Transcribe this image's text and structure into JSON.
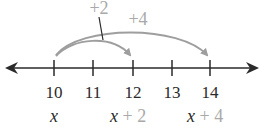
{
  "diagram": {
    "type": "number-line",
    "ticks": [
      {
        "value": "10",
        "x": 54
      },
      {
        "value": "11",
        "x": 93
      },
      {
        "value": "12",
        "x": 133
      },
      {
        "value": "13",
        "x": 172
      },
      {
        "value": "14",
        "x": 210
      }
    ],
    "expressions": [
      {
        "var": "x",
        "suffix": "",
        "x": 54
      },
      {
        "var": "x",
        "suffix": " + 2",
        "x": 133
      },
      {
        "var": "x",
        "suffix": " + 4",
        "x": 210
      }
    ],
    "jumps": [
      {
        "label": "+2",
        "from": "10",
        "to": "12"
      },
      {
        "label": "+4",
        "from": "10",
        "to": "14"
      }
    ],
    "colors": {
      "line": "#2a2a2a",
      "arc": "#9e9e9e",
      "text": "#2a2a2a",
      "accent_text": "#a9a9a9"
    }
  }
}
